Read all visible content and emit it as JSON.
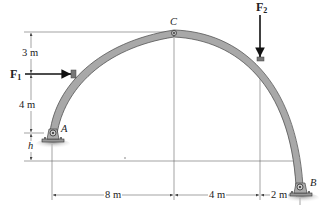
{
  "figure": {
    "colors": {
      "arch_fill": "#a8a8a8",
      "arch_edge": "#555555",
      "dimension_line": "#555555",
      "force_arrow": "#111111",
      "ground_shadow": "#9a9a9a"
    }
  },
  "points": {
    "A": {
      "label": "A"
    },
    "B": {
      "label": "B"
    },
    "C": {
      "label": "C"
    }
  },
  "forces": {
    "F1": {
      "symbol": "F",
      "subscript": "1",
      "direction": "right (horizontal)"
    },
    "F2": {
      "symbol": "F",
      "subscript": "2",
      "direction": "down (vertical)"
    }
  },
  "dimensions": {
    "vertical": {
      "top": "3 m",
      "middle": "4 m",
      "bottom": "h"
    },
    "horizontal": {
      "left": "8 m",
      "middle": "4 m",
      "right": "2 m"
    }
  }
}
